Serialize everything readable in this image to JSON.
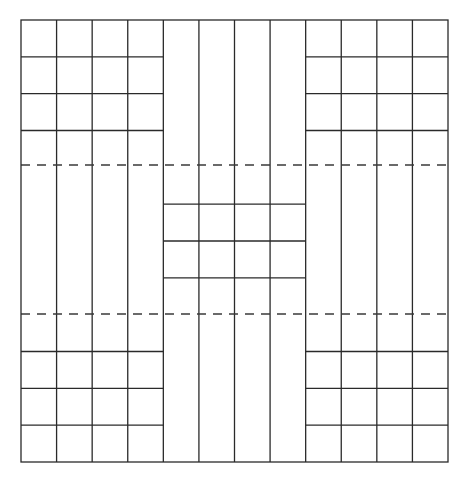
{
  "diagram": {
    "type": "tiling-grid",
    "colors": {
      "line": "#2a2a2a",
      "dash": "#3a3a3a",
      "background": "#ffffff"
    },
    "bounds": {
      "x0": 21,
      "y0": 20,
      "x1": 448,
      "y1": 462
    },
    "columns": 12,
    "rows": 12,
    "bands": [
      {
        "name": "left",
        "col_start": 0,
        "col_end": 4,
        "horizontal_row_lines": [
          1,
          2,
          3,
          9,
          10,
          11
        ]
      },
      {
        "name": "middle",
        "col_start": 4,
        "col_end": 8,
        "horizontal_row_lines": [
          5,
          6,
          7
        ]
      },
      {
        "name": "right",
        "col_start": 8,
        "col_end": 12,
        "horizontal_row_lines": [
          1,
          2,
          3,
          9,
          10,
          11
        ]
      }
    ],
    "dashed_lines_y": [
      165,
      314
    ]
  }
}
